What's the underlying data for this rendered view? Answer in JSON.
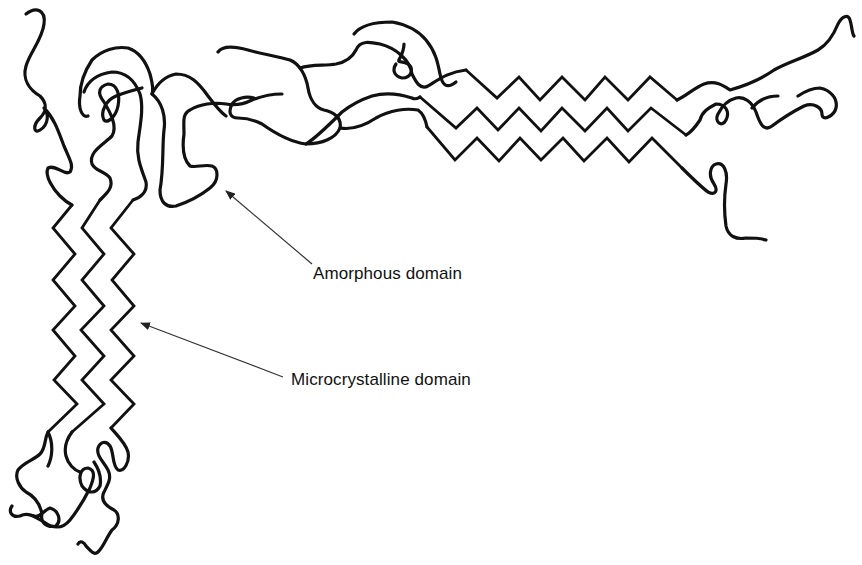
{
  "diagram": {
    "labels": {
      "amorphous": "Amorphous domain",
      "microcrystalline": "Microcrystalline domain"
    },
    "colors": {
      "stroke": "#111111",
      "background": "#ffffff"
    },
    "regions": [
      {
        "name": "amorphous domain",
        "depiction": "randomly coiled chains"
      },
      {
        "name": "microcrystalline domain",
        "depiction": "parallel zigzag chains (vertical band and horizontal band)"
      }
    ]
  }
}
